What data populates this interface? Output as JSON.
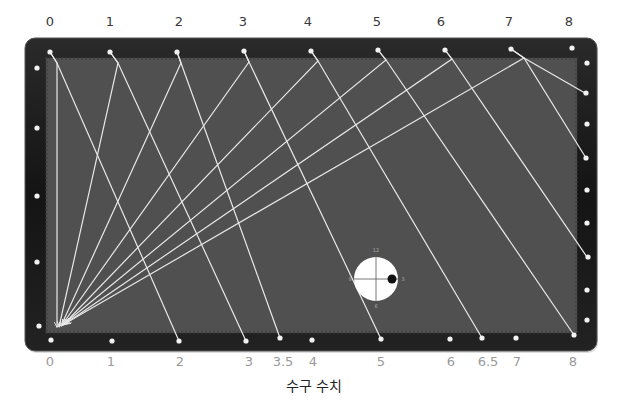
{
  "diagram": {
    "caption": "수구 수치",
    "colors": {
      "rail": "#141414",
      "felt": "#505050",
      "line": "#e8e8e8",
      "diamond": "#f2f2f2",
      "top_label": "#3a3a3a",
      "bottom_label": "#9a9a9a",
      "cue_ball": "#ffffff",
      "tip_dot": "#111111"
    },
    "table": {
      "x": 25,
      "y": 38,
      "w": 572,
      "h": 313,
      "radius": 10,
      "felt": {
        "x": 46,
        "y": 58,
        "w": 531,
        "h": 275
      }
    },
    "top_labels": [
      {
        "text": "0",
        "x": 50
      },
      {
        "text": "1",
        "x": 110
      },
      {
        "text": "2",
        "x": 179
      },
      {
        "text": "3",
        "x": 243
      },
      {
        "text": "4",
        "x": 308
      },
      {
        "text": "5",
        "x": 377
      },
      {
        "text": "6",
        "x": 441
      },
      {
        "text": "7",
        "x": 509
      },
      {
        "text": "8",
        "x": 569
      }
    ],
    "bottom_labels": [
      {
        "text": "0",
        "x": 50
      },
      {
        "text": "1",
        "x": 111
      },
      {
        "text": "2",
        "x": 180
      },
      {
        "text": "3",
        "x": 249
      },
      {
        "text": "3.5",
        "x": 283
      },
      {
        "text": "4",
        "x": 313
      },
      {
        "text": "5",
        "x": 381
      },
      {
        "text": "6",
        "x": 451
      },
      {
        "text": "6.5",
        "x": 488
      },
      {
        "text": "7",
        "x": 517
      },
      {
        "text": "8",
        "x": 573
      }
    ],
    "top_diamonds": [
      {
        "x": 50,
        "y": 52
      },
      {
        "x": 110,
        "y": 52
      },
      {
        "x": 177,
        "y": 52
      },
      {
        "x": 244,
        "y": 51
      },
      {
        "x": 311,
        "y": 51
      },
      {
        "x": 378,
        "y": 50
      },
      {
        "x": 445,
        "y": 50
      },
      {
        "x": 511,
        "y": 49
      },
      {
        "x": 572,
        "y": 48
      }
    ],
    "bottom_diamonds": [
      {
        "x": 51,
        "y": 340
      },
      {
        "x": 112,
        "y": 341
      },
      {
        "x": 179,
        "y": 341
      },
      {
        "x": 246,
        "y": 341
      },
      {
        "x": 280,
        "y": 338
      },
      {
        "x": 312,
        "y": 340
      },
      {
        "x": 381,
        "y": 339
      },
      {
        "x": 450,
        "y": 339
      },
      {
        "x": 482,
        "y": 338
      },
      {
        "x": 516,
        "y": 338
      },
      {
        "x": 574,
        "y": 335
      }
    ],
    "left_diamonds": [
      {
        "x": 37,
        "y": 68
      },
      {
        "x": 37,
        "y": 128
      },
      {
        "x": 37,
        "y": 196
      },
      {
        "x": 37,
        "y": 262
      },
      {
        "x": 39,
        "y": 326
      }
    ],
    "right_diamonds": [
      {
        "x": 587,
        "y": 63
      },
      {
        "x": 586,
        "y": 93
      },
      {
        "x": 587,
        "y": 124
      },
      {
        "x": 586,
        "y": 158
      },
      {
        "x": 587,
        "y": 190
      },
      {
        "x": 587,
        "y": 223
      },
      {
        "x": 588,
        "y": 257
      },
      {
        "x": 587,
        "y": 290
      },
      {
        "x": 587,
        "y": 320
      }
    ],
    "paths": [
      {
        "from": "0",
        "points": [
          [
            50,
            52
          ],
          [
            57,
            63
          ],
          [
            57,
            327
          ]
        ]
      },
      {
        "from": "0",
        "points": [
          [
            50,
            52
          ],
          [
            57,
            63
          ],
          [
            179,
            341
          ]
        ]
      },
      {
        "from": "1",
        "points": [
          [
            110,
            52
          ],
          [
            118,
            63
          ],
          [
            59,
            327
          ]
        ]
      },
      {
        "from": "1",
        "points": [
          [
            110,
            52
          ],
          [
            118,
            63
          ],
          [
            246,
            341
          ]
        ]
      },
      {
        "from": "2",
        "points": [
          [
            177,
            52
          ],
          [
            181,
            63
          ],
          [
            61,
            326
          ]
        ]
      },
      {
        "from": "2",
        "points": [
          [
            177,
            52
          ],
          [
            181,
            63
          ],
          [
            280,
            338
          ]
        ]
      },
      {
        "from": "3",
        "points": [
          [
            244,
            51
          ],
          [
            249,
            62
          ],
          [
            62,
            325
          ]
        ]
      },
      {
        "from": "3",
        "points": [
          [
            244,
            51
          ],
          [
            249,
            62
          ],
          [
            381,
            339
          ]
        ]
      },
      {
        "from": "4",
        "points": [
          [
            311,
            51
          ],
          [
            318,
            61
          ],
          [
            63,
            325
          ]
        ]
      },
      {
        "from": "4",
        "points": [
          [
            311,
            51
          ],
          [
            318,
            61
          ],
          [
            482,
            338
          ]
        ]
      },
      {
        "from": "5",
        "points": [
          [
            378,
            50
          ],
          [
            386,
            60
          ],
          [
            64,
            324
          ]
        ]
      },
      {
        "from": "5",
        "points": [
          [
            378,
            50
          ],
          [
            386,
            60
          ],
          [
            574,
            335
          ]
        ]
      },
      {
        "from": "6",
        "points": [
          [
            445,
            50
          ],
          [
            452,
            59
          ],
          [
            65,
            324
          ]
        ]
      },
      {
        "from": "6",
        "points": [
          [
            445,
            50
          ],
          [
            452,
            59
          ],
          [
            587,
            257
          ]
        ]
      },
      {
        "from": "7",
        "points": [
          [
            511,
            49
          ],
          [
            524,
            58
          ],
          [
            66,
            323
          ]
        ]
      },
      {
        "from": "7",
        "points": [
          [
            511,
            49
          ],
          [
            524,
            58
          ],
          [
            586,
            158
          ]
        ]
      },
      {
        "from": "7.5",
        "points": [
          [
            524,
            58
          ],
          [
            585,
            93
          ]
        ]
      }
    ],
    "cue_ball": {
      "cx": 376,
      "cy": 279,
      "r": 22,
      "tip": {
        "cx": 392,
        "cy": 279,
        "r": 4.5
      },
      "clock_labels": [
        {
          "text": "12",
          "x": 376,
          "y": 252
        },
        {
          "text": "3",
          "x": 403,
          "y": 281
        },
        {
          "text": "6",
          "x": 376,
          "y": 308
        },
        {
          "text": "9",
          "x": 350,
          "y": 281
        }
      ]
    },
    "arrow_target": {
      "x": 59,
      "y": 327
    }
  }
}
